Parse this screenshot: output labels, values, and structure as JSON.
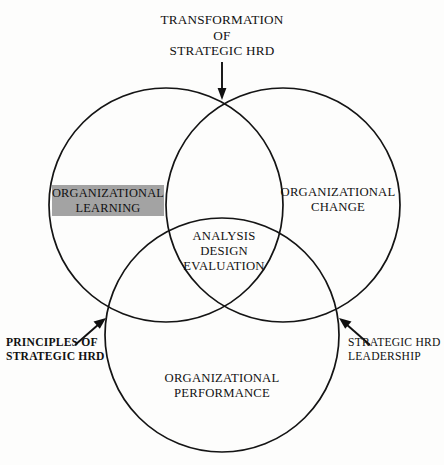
{
  "diagram": {
    "type": "venn",
    "title_top": {
      "lines": [
        "TRANSFORMATION",
        "OF",
        "STRATEGIC HRD"
      ],
      "line1": "TRANSFORMATION",
      "line2": "OF",
      "line3": "STRATEGIC HRD"
    },
    "circles": [
      {
        "id": "left",
        "label_line1": "ORGANIZATIONAL",
        "label_line2": "LEARNING",
        "highlighted": true,
        "highlight_color": "#a3a3a3",
        "cx": 166,
        "cy": 205,
        "r": 117
      },
      {
        "id": "right",
        "label_line1": "ORGANIZATIONAL",
        "label_line2": "CHANGE",
        "highlighted": false,
        "cx": 283,
        "cy": 205,
        "r": 117
      },
      {
        "id": "bottom",
        "label_line1": "ORGANIZATIONAL",
        "label_line2": "PERFORMANCE",
        "highlighted": false,
        "cx": 222,
        "cy": 335,
        "r": 117
      }
    ],
    "center_intersection": {
      "line1": "ANALYSIS",
      "line2": "DESIGN",
      "line3": "EVALUATION"
    },
    "callouts": [
      {
        "id": "principles",
        "line1": "PRINCIPLES OF",
        "line2": "STRATEGIC HRD",
        "points_to": "left-bottom-intersection"
      },
      {
        "id": "leadership",
        "line1": "STRATEGIC HRD",
        "line2": "LEADERSHIP",
        "points_to": "right-bottom-intersection"
      }
    ],
    "stroke_color": "#141414",
    "background_color": "#fdfdfc"
  }
}
